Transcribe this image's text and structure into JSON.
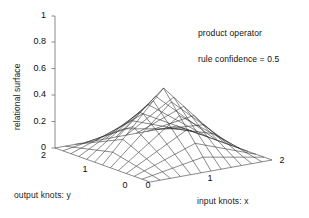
{
  "chart_data": {
    "type": "surface",
    "title": "",
    "xlabel": "input knots: x",
    "ylabel": "output knots: y",
    "zlabel": "relational surface",
    "annotations": [
      "product operator",
      "rule confidence = 0.5"
    ],
    "operator": "product",
    "rule_confidence": 0.5,
    "grid": false,
    "legend": "none",
    "projection": "3d-mesh",
    "xlim": [
      0,
      2
    ],
    "ylim": [
      0,
      2
    ],
    "zlim": [
      0,
      1
    ],
    "z_ticks": [
      "0",
      "0.2",
      "0.4",
      "0.6",
      "0.8",
      "1"
    ],
    "z_tick_values": [
      0,
      0.2,
      0.4,
      0.6,
      0.8,
      1
    ],
    "x_ticks": [
      "0",
      "1",
      "2"
    ],
    "x_tick_values": [
      0,
      1,
      2
    ],
    "y_ticks": [
      "0",
      "1",
      "2"
    ],
    "y_tick_values": [
      0,
      1,
      2
    ],
    "mesh_divisions": 12,
    "peak_value": 0.42,
    "peak_at": [
      1,
      1
    ],
    "x": [
      0,
      0.1667,
      0.3333,
      0.5,
      0.6667,
      0.8333,
      1,
      1.1667,
      1.3333,
      1.5,
      1.6667,
      1.8333,
      2
    ],
    "y": [
      0,
      0.1667,
      0.3333,
      0.5,
      0.6667,
      0.8333,
      1,
      1.1667,
      1.3333,
      1.5,
      1.6667,
      1.8333,
      2
    ],
    "z": [
      [
        0,
        0,
        0,
        0,
        0,
        0,
        0,
        0,
        0,
        0,
        0,
        0,
        0
      ],
      [
        0,
        0.0139,
        0.0278,
        0.0417,
        0.0556,
        0.0694,
        0.0833,
        0.0694,
        0.0556,
        0.0417,
        0.0278,
        0.0139,
        0
      ],
      [
        0,
        0.0278,
        0.0556,
        0.0833,
        0.1111,
        0.1389,
        0.1667,
        0.1389,
        0.1111,
        0.0833,
        0.0556,
        0.0278,
        0
      ],
      [
        0,
        0.0417,
        0.0833,
        0.125,
        0.1667,
        0.2083,
        0.25,
        0.2083,
        0.1667,
        0.125,
        0.0833,
        0.0417,
        0
      ],
      [
        0,
        0.0556,
        0.1111,
        0.1667,
        0.2222,
        0.2778,
        0.3333,
        0.2778,
        0.2222,
        0.1667,
        0.1111,
        0.0556,
        0
      ],
      [
        0,
        0.0694,
        0.1389,
        0.2083,
        0.2778,
        0.3472,
        0.4167,
        0.3472,
        0.2778,
        0.2083,
        0.1389,
        0.0694,
        0
      ],
      [
        0,
        0.0833,
        0.1667,
        0.25,
        0.3333,
        0.4167,
        0.5,
        0.4167,
        0.3333,
        0.25,
        0.1667,
        0.0833,
        0
      ],
      [
        0,
        0.0694,
        0.1389,
        0.2083,
        0.2778,
        0.3472,
        0.4167,
        0.3472,
        0.2778,
        0.2083,
        0.1389,
        0.0694,
        0
      ],
      [
        0,
        0.0556,
        0.1111,
        0.1667,
        0.2222,
        0.2778,
        0.3333,
        0.2778,
        0.2222,
        0.1667,
        0.1111,
        0.0556,
        0
      ],
      [
        0,
        0.0417,
        0.0833,
        0.125,
        0.1667,
        0.2083,
        0.25,
        0.2083,
        0.1667,
        0.125,
        0.0833,
        0.0417,
        0
      ],
      [
        0,
        0.0278,
        0.0556,
        0.0833,
        0.1111,
        0.1389,
        0.1667,
        0.1389,
        0.1111,
        0.0833,
        0.0556,
        0.0278,
        0
      ],
      [
        0,
        0.0139,
        0.0278,
        0.0417,
        0.0556,
        0.0694,
        0.0833,
        0.0694,
        0.0556,
        0.0417,
        0.0278,
        0.0139,
        0
      ],
      [
        0,
        0,
        0,
        0,
        0,
        0,
        0,
        0,
        0,
        0,
        0,
        0,
        0
      ]
    ],
    "z_scale_factor": 0.84,
    "colors": {
      "mesh": "#2b2b2b",
      "axis": "#6f6f6f",
      "background": "#ffffff",
      "text": "#111111"
    }
  },
  "axes": {
    "z_label": "relational surface",
    "x_label": "input knots: x",
    "y_label": "output knots: y",
    "z_ticks": [
      "1",
      "0.8",
      "0.6",
      "0.4",
      "0.2",
      "0"
    ],
    "x_ticks": [
      "0",
      "1",
      "2"
    ],
    "y_ticks": [
      "2",
      "1",
      "0"
    ]
  },
  "annotations": {
    "operator_text": "product operator",
    "confidence_text": "rule confidence = 0.5"
  }
}
